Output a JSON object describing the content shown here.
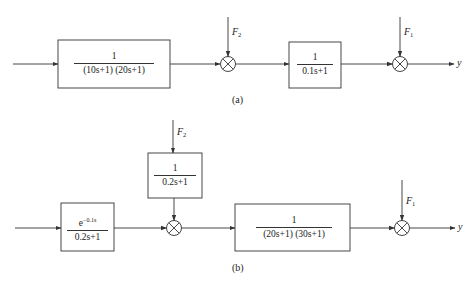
{
  "diagram_a": {
    "caption": "(a)",
    "block1": {
      "numerator": "1",
      "denominator": "(10s+1) (20s+1)"
    },
    "block2": {
      "numerator": "1",
      "denominator": "0.1s+1"
    },
    "disturbance_1": {
      "label": "F",
      "sub": "2"
    },
    "disturbance_2": {
      "label": "F",
      "sub": "1"
    },
    "output": "y"
  },
  "diagram_b": {
    "caption": "(b)",
    "block_delay": {
      "numerator_base": "e",
      "numerator_exp": "−0.1s",
      "denominator": "0.2s+1"
    },
    "block_dist": {
      "numerator": "1",
      "denominator": "0.2s+1"
    },
    "block_main": {
      "numerator": "1",
      "denominator": "(20s+1) (30s+1)"
    },
    "disturbance_1": {
      "label": "F",
      "sub": "2"
    },
    "disturbance_2": {
      "label": "F",
      "sub": "1"
    },
    "output": "y"
  }
}
